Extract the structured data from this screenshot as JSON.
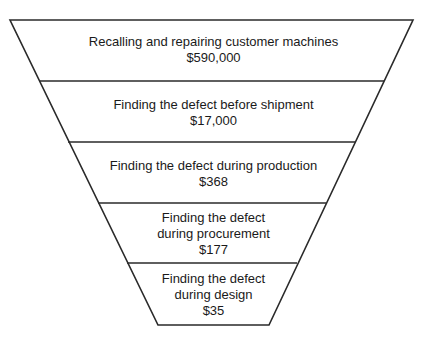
{
  "diagram": {
    "type": "inverted-funnel",
    "line_color": "#2a2a2a",
    "text_color": "#1a1a1a",
    "levels": [
      {
        "lines": [
          "Recalling and repairing customer machines"
        ],
        "cost": "$590,000"
      },
      {
        "lines": [
          "Finding the defect before shipment"
        ],
        "cost": "$17,000"
      },
      {
        "lines": [
          "Finding the defect during production"
        ],
        "cost": "$368"
      },
      {
        "lines": [
          "Finding the defect",
          "during procurement"
        ],
        "cost": "$177"
      },
      {
        "lines": [
          "Finding the defect",
          "during design"
        ],
        "cost": "$35"
      }
    ]
  }
}
